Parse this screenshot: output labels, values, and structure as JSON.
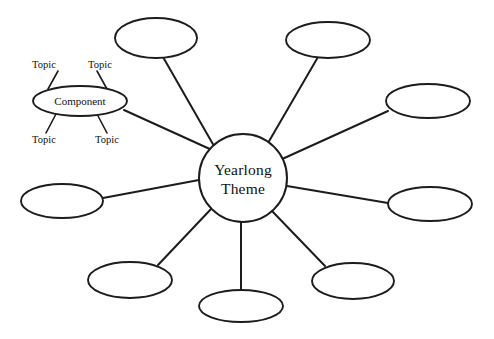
{
  "diagram": {
    "kind": "concept-web",
    "background_color": "#ffffff",
    "stroke_color": "#1c1c1c",
    "center": {
      "label_line1": "Yearlong",
      "label_line2": "Theme",
      "shape": "circle",
      "cx": 243,
      "cy": 178,
      "r": 44
    },
    "component": {
      "label": "Component",
      "shape": "ellipse",
      "cx": 80,
      "cy": 101,
      "rx": 47,
      "ry": 15
    },
    "topics": [
      {
        "label": "Topic",
        "x": 44,
        "y": 66,
        "line": [
          58,
          70,
          47,
          88
        ]
      },
      {
        "label": "Topic",
        "x": 100,
        "y": 66,
        "line": [
          96,
          70,
          106,
          89
        ]
      },
      {
        "label": "Topic",
        "x": 44,
        "y": 142,
        "line": [
          56,
          131,
          45,
          134
        ]
      },
      {
        "label": "Topic",
        "x": 107,
        "y": 142,
        "line": [
          96,
          131,
          107,
          134
        ]
      }
    ],
    "nodes": [
      {
        "name": "node-top-left",
        "cx": 156,
        "cy": 38,
        "rx": 41,
        "ry": 20
      },
      {
        "name": "node-top-right",
        "cx": 328,
        "cy": 40,
        "rx": 42,
        "ry": 18
      },
      {
        "name": "node-right-upper",
        "cx": 428,
        "cy": 101,
        "rx": 42,
        "ry": 17
      },
      {
        "name": "node-right",
        "cx": 430,
        "cy": 204,
        "rx": 42,
        "ry": 17
      },
      {
        "name": "node-bottom-right",
        "cx": 353,
        "cy": 281,
        "rx": 41,
        "ry": 18
      },
      {
        "name": "node-bottom",
        "cx": 241,
        "cy": 306,
        "rx": 42,
        "ry": 16
      },
      {
        "name": "node-bottom-left",
        "cx": 130,
        "cy": 280,
        "rx": 42,
        "ry": 18
      },
      {
        "name": "node-left",
        "cx": 62,
        "cy": 201,
        "rx": 41,
        "ry": 17
      }
    ],
    "spokes": [
      {
        "name": "spoke-component",
        "x1": 124,
        "y1": 110,
        "x2": 212,
        "y2": 150
      },
      {
        "name": "spoke-top-left",
        "x1": 163,
        "y1": 57,
        "x2": 214,
        "y2": 146
      },
      {
        "name": "spoke-top-right",
        "x1": 318,
        "y1": 57,
        "x2": 268,
        "y2": 143
      },
      {
        "name": "spoke-right-upper",
        "x1": 388,
        "y1": 111,
        "x2": 280,
        "y2": 160
      },
      {
        "name": "spoke-right",
        "x1": 388,
        "y1": 203,
        "x2": 287,
        "y2": 186
      },
      {
        "name": "spoke-bottom-right",
        "x1": 325,
        "y1": 266,
        "x2": 272,
        "y2": 211
      },
      {
        "name": "spoke-bottom",
        "x1": 241,
        "y1": 290,
        "x2": 241,
        "y2": 222
      },
      {
        "name": "spoke-bottom-left",
        "x1": 158,
        "y1": 265,
        "x2": 212,
        "y2": 208
      },
      {
        "name": "spoke-left",
        "x1": 103,
        "y1": 198,
        "x2": 199,
        "y2": 180
      }
    ]
  }
}
